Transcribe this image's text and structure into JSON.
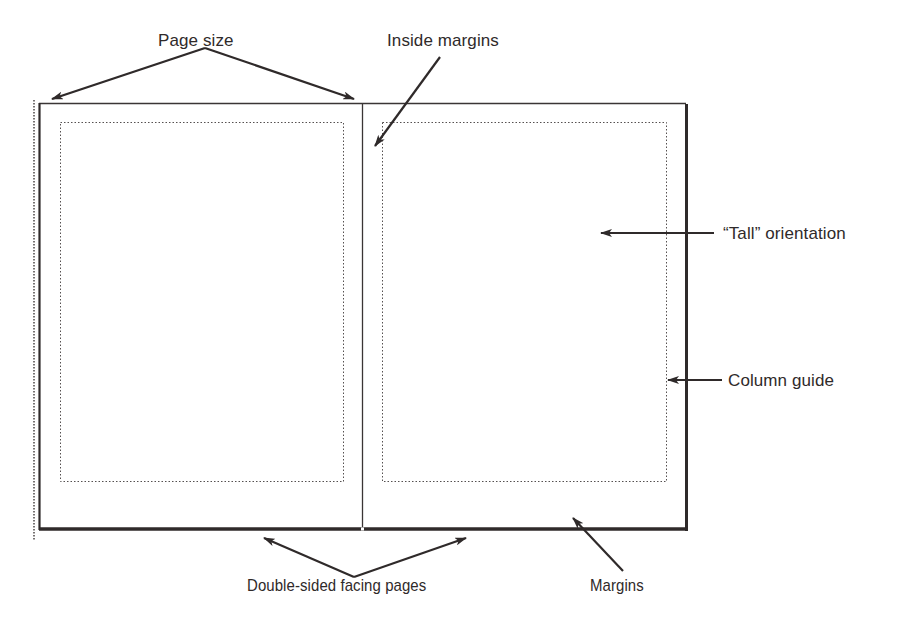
{
  "figure": {
    "type": "page-layout-diagram",
    "colors": {
      "ink": "#2f2a2a",
      "paper": "#ffffff",
      "guide": "#555050"
    }
  },
  "labels": {
    "page_size": "Page size",
    "inside_margins": "Inside margins",
    "tall_orientation": "“Tall” orientation",
    "column_guide": "Column guide",
    "double_sided": "Double-sided facing pages",
    "margins": "Margins"
  },
  "pages": [
    {
      "name": "left-page",
      "side": "left"
    },
    {
      "name": "right-page",
      "side": "right"
    }
  ]
}
